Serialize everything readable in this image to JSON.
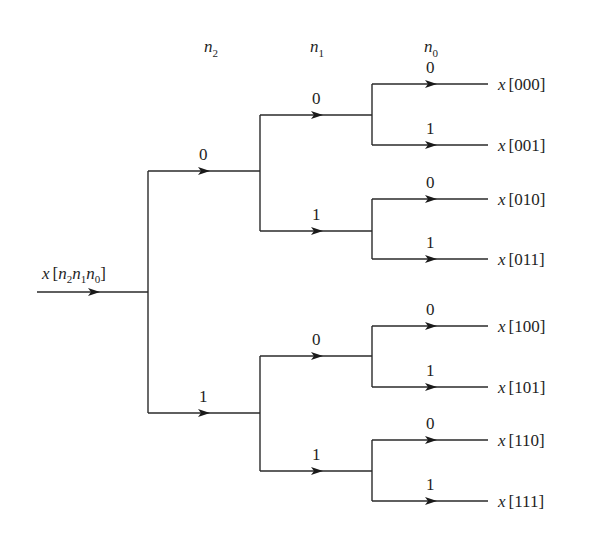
{
  "diagram": {
    "type": "binary-tree-decimation",
    "input_label": {
      "base": "x",
      "open": "[",
      "vars": [
        {
          "v": "n",
          "s": "2"
        },
        {
          "v": "n",
          "s": "1"
        },
        {
          "v": "n",
          "s": "0"
        }
      ],
      "close": "]"
    },
    "headers": [
      {
        "var": "n",
        "sub": "2"
      },
      {
        "var": "n",
        "sub": "1"
      },
      {
        "var": "n",
        "sub": "0"
      }
    ],
    "level1_branches": [
      {
        "bit": "0"
      },
      {
        "bit": "1"
      }
    ],
    "level2_branches": [
      {
        "bit": "0"
      },
      {
        "bit": "1"
      },
      {
        "bit": "0"
      },
      {
        "bit": "1"
      }
    ],
    "level3_branches": [
      {
        "bit": "0"
      },
      {
        "bit": "1"
      },
      {
        "bit": "0"
      },
      {
        "bit": "1"
      },
      {
        "bit": "0"
      },
      {
        "bit": "1"
      },
      {
        "bit": "0"
      },
      {
        "bit": "1"
      }
    ],
    "outputs": [
      {
        "base": "x",
        "index": "[000]"
      },
      {
        "base": "x",
        "index": "[001]"
      },
      {
        "base": "x",
        "index": "[010]"
      },
      {
        "base": "x",
        "index": "[011]"
      },
      {
        "base": "x",
        "index": "[100]"
      },
      {
        "base": "x",
        "index": "[101]"
      },
      {
        "base": "x",
        "index": "[110]"
      },
      {
        "base": "x",
        "index": "[111]"
      }
    ],
    "colors": {
      "line": "#2a2a2a",
      "text": "#1e1e1e",
      "background": "#ffffff"
    }
  }
}
